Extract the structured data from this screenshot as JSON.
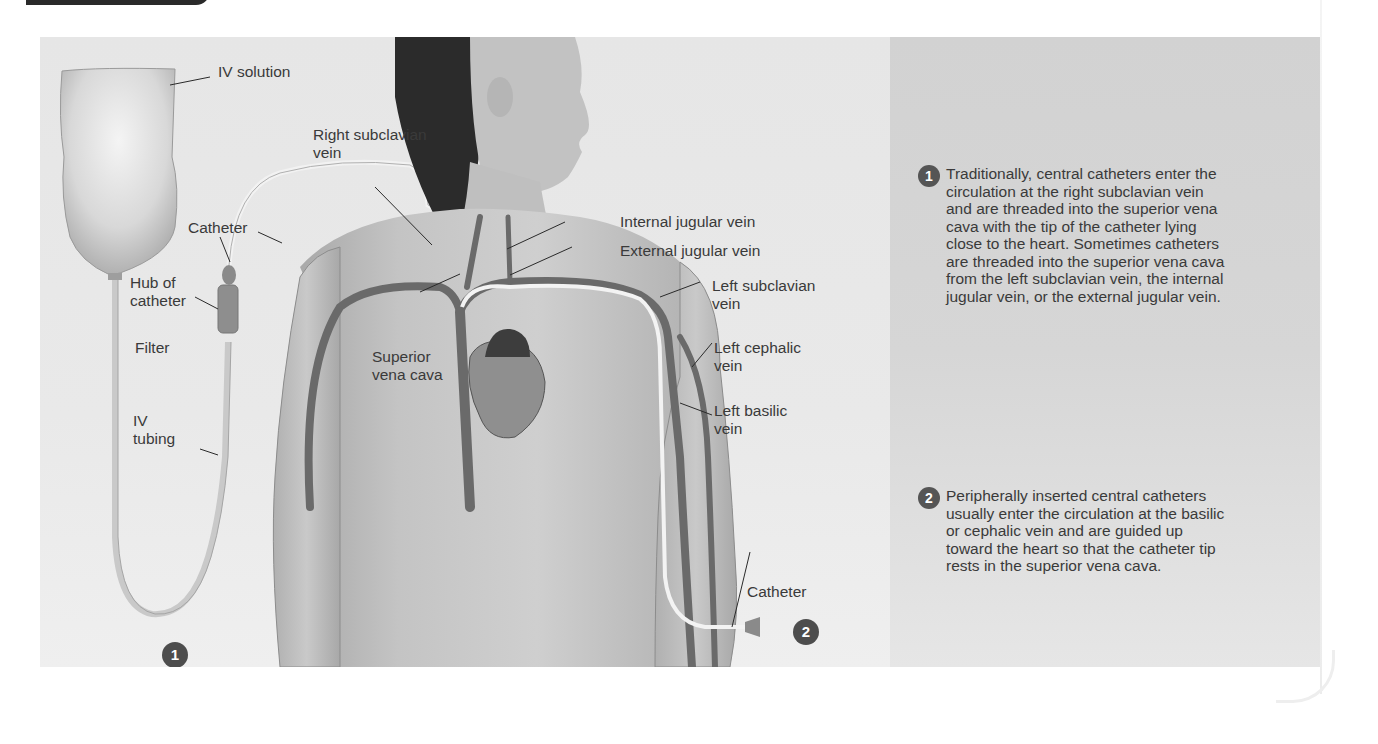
{
  "figure": {
    "labels": {
      "iv_solution": "IV solution",
      "right_subclavian_vein": "Right subclavian\nvein",
      "catheter_top": "Catheter",
      "hub_of_catheter": "Hub of\ncatheter",
      "filter": "Filter",
      "iv_tubing": "IV\ntubing",
      "superior_vena_cava": "Superior\nvena cava",
      "internal_jugular_vein": "Internal jugular vein",
      "external_jugular_vein": "External jugular vein",
      "left_subclavian_vein": "Left subclavian\nvein",
      "left_cephalic_vein": "Left cephalic\nvein",
      "left_basilic_vein": "Left basilic\nvein",
      "catheter_bottom": "Catheter"
    },
    "badges": {
      "one": "1",
      "two": "2"
    }
  },
  "steps": [
    {
      "number": "1",
      "text": "Traditionally, central catheters enter the circulation at the right subclavian vein and are threaded into the superior vena cava with the tip of the catheter lying close to the heart. Sometimes catheters are threaded into the superior vena cava from the left subclavian vein, the internal jugular vein, or the external jugular vein."
    },
    {
      "number": "2",
      "text": "Peripherally inserted central catheters usually enter the circulation at the basilic or cephalic vein and are guided up toward the heart so that the catheter tip rests in the superior vena cava."
    }
  ],
  "colors": {
    "panel_bg": "#e4e4e4",
    "text_panel_bg": "#d4d4d4",
    "badge": "#4d4d4d",
    "text": "#3a3a3a"
  }
}
